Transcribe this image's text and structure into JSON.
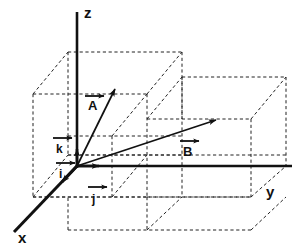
{
  "figure": {
    "background_color": "#ffffff",
    "stroke_color": "#111111"
  },
  "axes": {
    "z": {
      "label": "z",
      "label_x": 84,
      "label_y": 17
    },
    "y": {
      "label": "y",
      "label_x": 268,
      "label_y": 196
    },
    "x": {
      "label": "x",
      "label_x": 22,
      "label_y": 241
    }
  },
  "vectors": [
    {
      "name": "A",
      "label": "A",
      "label_x": 88,
      "label_y": 107,
      "overline": true,
      "from_x": 77,
      "from_y": 166,
      "to_x": 115,
      "to_y": 88
    },
    {
      "name": "B",
      "label": "B",
      "label_x": 186,
      "label_y": 153,
      "overline": true,
      "from_x": 77,
      "from_y": 166,
      "to_x": 215,
      "to_y": 119
    }
  ],
  "unit_vectors": [
    {
      "name": "k",
      "label": "k",
      "label_x": 57,
      "label_y": 151,
      "overline": true,
      "from_x": 77,
      "from_y": 166,
      "to_x": 77,
      "to_y": 150,
      "direction": "up-z"
    },
    {
      "name": "i",
      "label": "i",
      "label_x": 60,
      "label_y": 176,
      "overline": true,
      "from_x": 77,
      "from_y": 166,
      "to_x": 65,
      "to_y": 180,
      "direction": "toward-x"
    },
    {
      "name": "j",
      "label": "j",
      "label_x": 96,
      "label_y": 203,
      "overline": true,
      "from_x": 77,
      "from_y": 166,
      "to_x": 97,
      "to_y": 166,
      "direction": "along-y"
    }
  ],
  "geometry": {
    "origin": {
      "x": 77,
      "y": 166
    },
    "z_axis_top": {
      "x": 77,
      "y": 12
    },
    "y_axis_end": {
      "x": 292,
      "y": 166
    },
    "x_axis_end": {
      "x": 14,
      "y": 232
    },
    "depth_dx": -35,
    "depth_dy": 42
  }
}
